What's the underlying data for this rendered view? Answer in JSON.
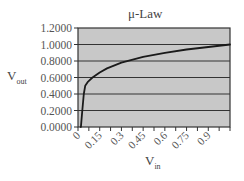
{
  "chart_data": {
    "type": "line",
    "title": "μ-Law",
    "xlabel": "V_in",
    "ylabel": "V_out",
    "x_ticks": [
      "0",
      "0.15",
      "0.3",
      "0.45",
      "0.6",
      "0.75",
      "0.9"
    ],
    "y_ticks": [
      "0.0000",
      "0.2000",
      "0.4000",
      "0.6000",
      "0.8000",
      "1.0000",
      "1.2000"
    ],
    "xlim": [
      0,
      1.05
    ],
    "ylim": [
      0,
      1.2
    ],
    "grid": "horizontal",
    "legend": "none",
    "plot_background": "#c8c8c8",
    "line_color": "#1a1a1a",
    "series": [
      {
        "name": "μ-Law",
        "x": [
          0.02,
          0.03,
          0.04,
          0.05,
          0.07,
          0.1,
          0.15,
          0.2,
          0.3,
          0.45,
          0.6,
          0.75,
          0.9,
          1.05
        ],
        "y": [
          0.0,
          0.2,
          0.4,
          0.5,
          0.55,
          0.6,
          0.66,
          0.71,
          0.78,
          0.85,
          0.9,
          0.94,
          0.97,
          1.0
        ]
      }
    ]
  },
  "labels": {
    "title": "μ-Law",
    "ylabel_main": "V",
    "ylabel_sub": "out",
    "xlabel_main": "V",
    "xlabel_sub": "in"
  }
}
